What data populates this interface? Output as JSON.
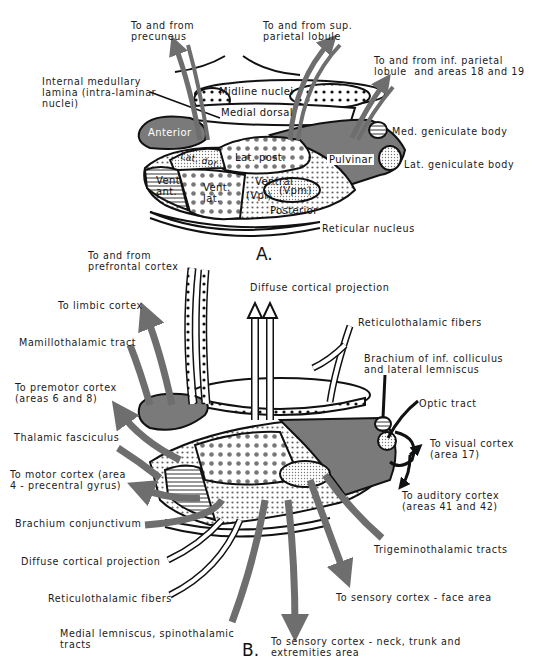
{
  "panel_a": {
    "caption": "A.",
    "labels": {
      "precuneus": "To and from\nprecuneus",
      "sup_parietal": "To and from sup.\nparietal lobule",
      "inf_parietal": "To and from inf. parietal\nlobule  and areas 18 and 19",
      "internal_medullary": "Internal medullary\nlamina (intra-laminar\nnuclei)",
      "med_geniculate": "Med. geniculate body",
      "lat_geniculate": "Lat. geniculate body",
      "reticular": "Reticular nucleus"
    },
    "nuclei": {
      "midline": "Midline nuclei",
      "medial_dorsal": "Medial dorsal",
      "anterior": "Anterior",
      "lat_post": "Lat. post.",
      "lat_dor": "Lat. dor.",
      "pulvinar": "Pulvinar",
      "vent_ant": "Vent.\nant.",
      "vent_lat": "Vent.\nlat.",
      "ventral": "Ventral",
      "vpl": "(Vpl)",
      "vpm": "(Vpm)",
      "posterior": "Posterior"
    }
  },
  "panel_b": {
    "caption": "B.",
    "labels": {
      "prefrontal": "To and from\nprefrontal cortex",
      "diffuse_top": "Diffuse cortical projection",
      "limbic": "To limbic cortex",
      "reticulothalamic_top": "Reticulothalamic fibers",
      "mamillothalamic": "Mamillothalamic tract",
      "brachium_inf": "Brachium of inf. colliculus\nand lateral lemniscus",
      "premotor": "To premotor cortex\n(areas 6 and 8)",
      "optic": "Optic tract",
      "thalamic_fasciculus": "Thalamic fasciculus",
      "visual": "To visual cortex\n(area 17)",
      "motor": "To motor cortex (area\n4 - precentral gyrus)",
      "auditory": "To auditory cortex\n(areas 41 and 42)",
      "brachium_conj": "Brachium conjunctivum",
      "trigeminothalamic": "Trigeminothalamic tracts",
      "diffuse_bottom": "Diffuse cortical projection",
      "sensory_face": "To sensory cortex - face area",
      "reticulothalamic_bottom": "Reticulothalamic fibers",
      "medial_lemniscus": "Medial lemniscus, spinothalamic\ntracts",
      "sensory_neck": "To sensory cortex - neck, trunk and\nextremities area"
    }
  },
  "colors": {
    "ink": "#111111",
    "gray_fill": "#7a7a7a",
    "arrow_gray": "#6e6e6e",
    "paper": "#ffffff"
  }
}
